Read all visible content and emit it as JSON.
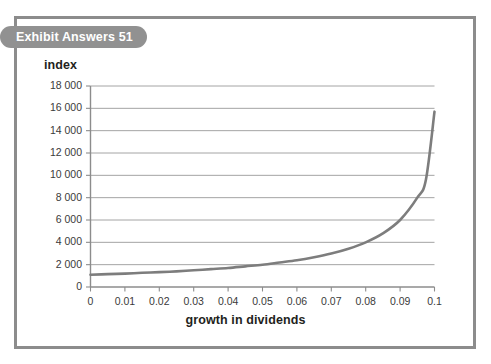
{
  "exhibit": {
    "pill_label": "Exhibit Answers 51"
  },
  "chart_data": {
    "type": "line",
    "title": "",
    "xlabel": "growth in dividends",
    "ylabel": "index",
    "xlim": [
      0,
      0.1
    ],
    "ylim": [
      0,
      18000
    ],
    "grid": true,
    "legend": "none",
    "x_tick_labels": [
      "0",
      "0.01",
      "0.02",
      "0.03",
      "0.04",
      "0.05",
      "0.06",
      "0.07",
      "0.08",
      "0.09",
      "0.1"
    ],
    "x_ticks": [
      0,
      0.01,
      0.02,
      0.03,
      0.04,
      0.05,
      0.06,
      0.07,
      0.08,
      0.09,
      0.1
    ],
    "y_tick_labels": [
      "0",
      "2 000",
      "4 000",
      "6 000",
      "8 000",
      "10 000",
      "12 000",
      "14 000",
      "16 000",
      "18 000"
    ],
    "y_ticks": [
      0,
      2000,
      4000,
      6000,
      8000,
      10000,
      12000,
      14000,
      16000,
      18000
    ],
    "series": [
      {
        "name": "index",
        "color": "#7d7d7d",
        "line_width": 2.6,
        "x": [
          0,
          0.005,
          0.01,
          0.015,
          0.02,
          0.025,
          0.03,
          0.035,
          0.04,
          0.045,
          0.05,
          0.055,
          0.06,
          0.065,
          0.07,
          0.075,
          0.08,
          0.085,
          0.09,
          0.095,
          0.0975,
          0.1
        ],
        "values": [
          1100,
          1150,
          1200,
          1270,
          1330,
          1400,
          1500,
          1600,
          1700,
          1850,
          2000,
          2200,
          2400,
          2670,
          3000,
          3430,
          4000,
          4800,
          6000,
          8000,
          9600,
          15700
        ]
      }
    ],
    "annotations": []
  }
}
